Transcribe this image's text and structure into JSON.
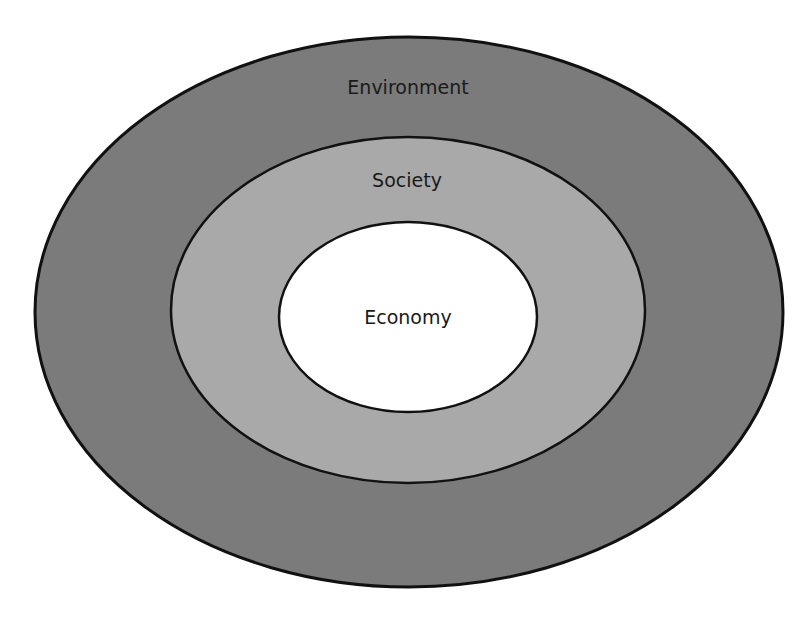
{
  "diagram": {
    "type": "nested-ellipses",
    "layers": [
      {
        "id": "environment",
        "label": "Environment",
        "fill": "#7b7b7b",
        "stroke": "#111111",
        "stroke_width": 3,
        "cx": 409,
        "cy": 312,
        "rx": 374,
        "ry": 275,
        "label_x": 408,
        "label_y": 94
      },
      {
        "id": "society",
        "label": "Society",
        "fill": "#a9a9a9",
        "stroke": "#111111",
        "stroke_width": 2.5,
        "cx": 408,
        "cy": 310,
        "rx": 237,
        "ry": 173,
        "label_x": 407,
        "label_y": 187
      },
      {
        "id": "economy",
        "label": "Economy",
        "fill": "#ffffff",
        "stroke": "#111111",
        "stroke_width": 2.5,
        "cx": 408,
        "cy": 317,
        "rx": 129,
        "ry": 95,
        "label_x": 408,
        "label_y": 324
      }
    ]
  }
}
